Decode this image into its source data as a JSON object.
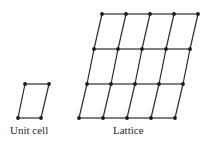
{
  "diagram": {
    "colors": {
      "line": "#2a2a2a",
      "point": "#1a1a1a",
      "text": "#2a2a2a"
    },
    "unit_cell": {
      "label": "Unit cell",
      "points": [
        [
          25,
          84
        ],
        [
          49,
          84
        ],
        [
          41,
          118
        ],
        [
          18,
          118
        ]
      ]
    },
    "lattice": {
      "label": "Lattice",
      "rows": [
        [
          [
            102,
            14
          ],
          [
            126,
            14
          ],
          [
            150,
            14
          ],
          [
            174,
            14
          ],
          [
            198,
            14
          ]
        ],
        [
          [
            94,
            49
          ],
          [
            118,
            49
          ],
          [
            142,
            49
          ],
          [
            166,
            49
          ],
          [
            190,
            49
          ]
        ],
        [
          [
            87,
            84
          ],
          [
            111,
            84
          ],
          [
            135,
            84
          ],
          [
            159,
            84
          ],
          [
            183,
            84
          ]
        ],
        [
          [
            79,
            118
          ],
          [
            103,
            118
          ],
          [
            127,
            118
          ],
          [
            151,
            118
          ],
          [
            175,
            118
          ]
        ]
      ]
    }
  }
}
